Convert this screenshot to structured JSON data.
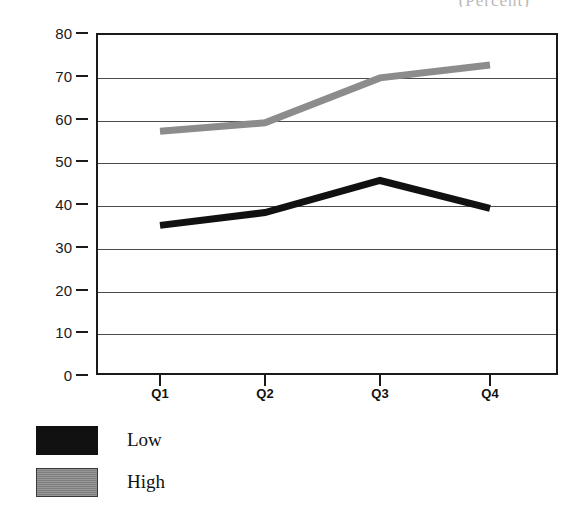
{
  "title_clipped": "(Percent)",
  "chart_data": {
    "type": "line",
    "title": "(Percent)",
    "xlabel": "",
    "ylabel": "",
    "categories": [
      "Q1",
      "Q2",
      "Q3",
      "Q4"
    ],
    "series": [
      {
        "name": "Low",
        "values": [
          35,
          38,
          45.5,
          39
        ],
        "color": "#111111"
      },
      {
        "name": "High",
        "values": [
          57,
          59,
          69.5,
          72.5
        ],
        "color": "#8c8c8c"
      }
    ],
    "ylim": [
      0,
      80
    ],
    "yticks": [
      0,
      10,
      20,
      30,
      40,
      50,
      60,
      70,
      80
    ],
    "ytick_labels": [
      "0",
      "10",
      "20",
      "30",
      "40",
      "50",
      "60",
      "70",
      "80"
    ],
    "grid": true,
    "legend_position": "below-left"
  },
  "legend": {
    "items": [
      {
        "label": "Low",
        "swatch": "black-swatch"
      },
      {
        "label": "High",
        "swatch": "gray-swatch"
      }
    ]
  }
}
